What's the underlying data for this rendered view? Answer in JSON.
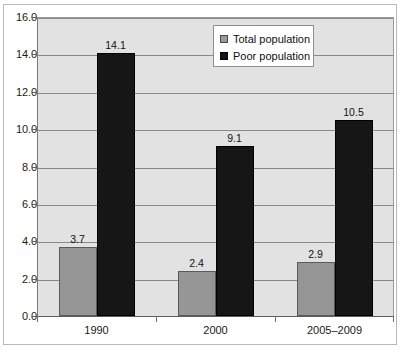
{
  "chart_data": {
    "type": "bar",
    "title": "",
    "subtitle": "",
    "xlabel": "",
    "ylabel": "",
    "categories": [
      "1990",
      "2000",
      "2005–2009"
    ],
    "series": [
      {
        "name": "Total population",
        "values": [
          3.7,
          2.4,
          2.9
        ],
        "color": "#969696"
      },
      {
        "name": "Poor population",
        "values": [
          14.1,
          9.1,
          10.5
        ],
        "color": "#161616"
      }
    ],
    "ylim": [
      0.0,
      16.0
    ],
    "ytick_step": 2.0,
    "yticks": [
      "0.0",
      "2.0",
      "4.0",
      "6.0",
      "8.0",
      "10.0",
      "12.0",
      "14.0",
      "16.0"
    ],
    "data_labels": [
      [
        "3.7",
        "2.4",
        "2.9"
      ],
      [
        "14.1",
        "9.1",
        "10.5"
      ]
    ],
    "grid": true,
    "legend_position": "top-center",
    "plot_background": "#e2e2e2"
  },
  "legend": {
    "entries": [
      {
        "label": "Total population",
        "swatch": "total"
      },
      {
        "label": "Poor population",
        "swatch": "poor"
      }
    ]
  }
}
